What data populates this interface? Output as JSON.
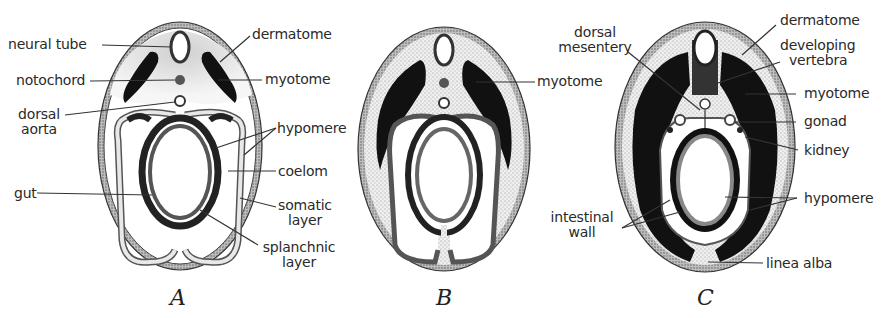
{
  "figure": {
    "panels": [
      {
        "id": "A",
        "letter": "A"
      },
      {
        "id": "B",
        "letter": "B"
      },
      {
        "id": "C",
        "letter": "C"
      }
    ]
  },
  "labels": {
    "A": {
      "neural_tube": "neural tube",
      "notochord": "notochord",
      "dorsal_aorta_1": "dorsal",
      "dorsal_aorta_2": "aorta",
      "gut": "gut",
      "dermatome": "dermatome",
      "myotome": "myotome",
      "hypomere": "hypomere",
      "coelom": "coelom",
      "somatic_1": "somatic",
      "somatic_2": "layer",
      "splanchnic_1": "splanchnic",
      "splanchnic_2": "layer"
    },
    "B": {
      "myotome": "myotome"
    },
    "C": {
      "dorsal_mesentery_1": "dorsal",
      "dorsal_mesentery_2": "mesentery",
      "intestinal_wall_1": "intestinal",
      "intestinal_wall_2": "wall",
      "dermatome": "dermatome",
      "developing_vertebra_1": "developing",
      "developing_vertebra_2": "vertebra",
      "myotome": "myotome",
      "gonad": "gonad",
      "kidney": "kidney",
      "hypomere": "hypomere",
      "linea_alba": "linea alba"
    }
  },
  "colors": {
    "ink": "#1a1a1a",
    "stipple": "#9a9a9a",
    "light_stipple": "#dcdcdc",
    "background": "#ffffff"
  }
}
